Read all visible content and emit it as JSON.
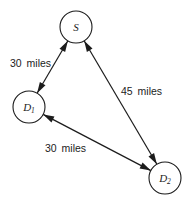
{
  "figure": {
    "background": "#ffffff",
    "ink": "#1c1c1c",
    "nodes": [
      {
        "id": "S",
        "label": "S",
        "subscript": "",
        "cx": 76,
        "cy": 27,
        "r": 16
      },
      {
        "id": "D1",
        "label": "D",
        "subscript": "1",
        "cx": 29,
        "cy": 107,
        "r": 16
      },
      {
        "id": "D2",
        "label": "D",
        "subscript": "2",
        "cx": 165,
        "cy": 178,
        "r": 16
      }
    ],
    "edges": [
      {
        "from": "D1",
        "to": "S",
        "label": "30 miles",
        "label_x": 10,
        "label_y": 67
      },
      {
        "from": "S",
        "to": "D2",
        "label": "45 miles",
        "label_x": 121,
        "label_y": 95
      },
      {
        "from": "D1",
        "to": "D2",
        "label": "30 miles",
        "label_x": 45,
        "label_y": 152
      }
    ],
    "arrow": {
      "double_headed": true,
      "head_length": 11,
      "head_width": 6.5
    }
  }
}
